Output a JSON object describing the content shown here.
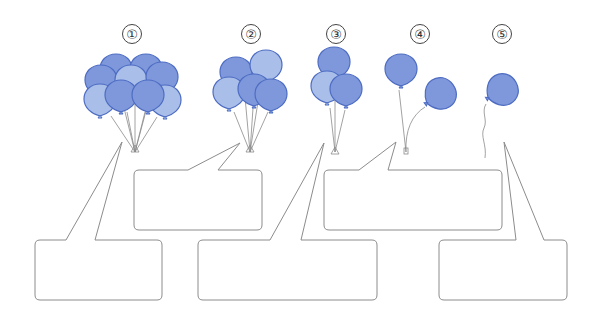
{
  "colors": {
    "balloon_dark": "#7f98dc",
    "balloon_light": "#a9bfe9",
    "balloon_stroke": "#4d6cc2",
    "string": "#8a8a8a",
    "callout_stroke": "#8c8c8c"
  },
  "groups": [
    {
      "label": "①",
      "balloon_count": 10
    },
    {
      "label": "②",
      "balloon_count": 5
    },
    {
      "label": "③",
      "balloon_count": 3
    },
    {
      "label": "④",
      "balloon_count": 2
    },
    {
      "label": "⑤",
      "balloon_count": 1
    }
  ],
  "callouts": [
    {
      "id": "1",
      "text": ""
    },
    {
      "id": "2",
      "text": ""
    },
    {
      "id": "3",
      "text": ""
    },
    {
      "id": "4",
      "text": ""
    },
    {
      "id": "5",
      "text": ""
    }
  ]
}
